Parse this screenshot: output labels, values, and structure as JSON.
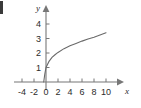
{
  "chart_data": {
    "type": "line",
    "title": "",
    "xlabel": "x",
    "ylabel": "y",
    "xlim": [
      -5,
      11.5
    ],
    "ylim": [
      -0.6,
      4.8
    ],
    "grid": false,
    "legend": null,
    "x_ticks": [
      -4,
      -2,
      0,
      2,
      4,
      6,
      8,
      10
    ],
    "x_tick_labels": [
      "-4",
      "-2",
      "0",
      "2",
      "4",
      "6",
      "8",
      "10"
    ],
    "y_ticks": [
      1,
      2,
      3,
      4
    ],
    "y_tick_labels": [
      "1",
      "2",
      "3",
      "4"
    ],
    "series": [
      {
        "name": "curve",
        "kind": "logarithmic",
        "x": [
          -0.38,
          -0.2,
          0,
          0.5,
          1,
          1.5,
          2,
          3,
          4,
          5,
          6,
          7,
          8,
          9,
          10
        ],
        "y": [
          0.0,
          0.55,
          1.0,
          1.42,
          1.7,
          1.88,
          2.04,
          2.3,
          2.5,
          2.66,
          2.82,
          2.96,
          3.08,
          3.24,
          3.4
        ]
      }
    ],
    "annotations": {
      "x_axis_arrow": true,
      "y_axis_arrow": true,
      "y_axis_label_position": "top-left-of-arrow",
      "x_axis_label_position": "right-below-arrow"
    },
    "colors": {
      "background": "#ffffff",
      "axis": "#777777",
      "curve": "#6a6a6a",
      "text": "#2b2b2b"
    }
  }
}
